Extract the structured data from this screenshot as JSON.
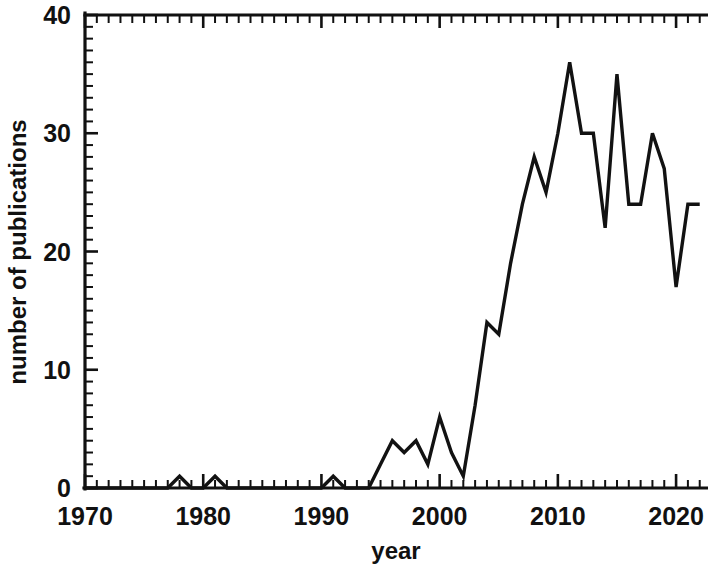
{
  "chart_data": {
    "type": "line",
    "title": "",
    "xlabel": "year",
    "ylabel": "number of publications",
    "xlim": [
      1970,
      2023
    ],
    "ylim": [
      0,
      40
    ],
    "grid": false,
    "legend": null,
    "x_ticks": [
      1970,
      1980,
      1990,
      2000,
      2010,
      2020
    ],
    "x_tick_labels": [
      "1970",
      "1980",
      "1990",
      "2000",
      "2010",
      "2020"
    ],
    "x_minor_tick_step": 1,
    "y_ticks": [
      0,
      10,
      20,
      30,
      40
    ],
    "y_tick_labels": [
      "0",
      "10",
      "20",
      "30",
      "40"
    ],
    "y_minor_tick_step": 1,
    "line_color": "#121212",
    "background_color": "#ffffff",
    "x": [
      1970,
      1971,
      1972,
      1973,
      1974,
      1975,
      1976,
      1977,
      1978,
      1979,
      1980,
      1981,
      1982,
      1983,
      1984,
      1985,
      1986,
      1987,
      1988,
      1989,
      1990,
      1991,
      1992,
      1993,
      1994,
      1995,
      1996,
      1997,
      1998,
      1999,
      2000,
      2001,
      2002,
      2003,
      2004,
      2005,
      2006,
      2007,
      2008,
      2009,
      2010,
      2011,
      2012,
      2013,
      2014,
      2015,
      2016,
      2017,
      2018,
      2019,
      2020,
      2021,
      2022
    ],
    "values": [
      0,
      0,
      0,
      0,
      0,
      0,
      0,
      0,
      1,
      0,
      0,
      1,
      0,
      0,
      0,
      0,
      0,
      0,
      0,
      0,
      0,
      1,
      0,
      0,
      0,
      2,
      4,
      3,
      4,
      2,
      6,
      3,
      1,
      7,
      14,
      13,
      19,
      24,
      28,
      25,
      30,
      36,
      30,
      30,
      22,
      35,
      24,
      24,
      30,
      27,
      17,
      24,
      24
    ],
    "series_name": "number of publications",
    "max_value": 36,
    "max_value_year": 2011,
    "min_value": 0
  },
  "labels": {
    "x_axis_title": "year",
    "y_axis_title": "number of publications"
  }
}
